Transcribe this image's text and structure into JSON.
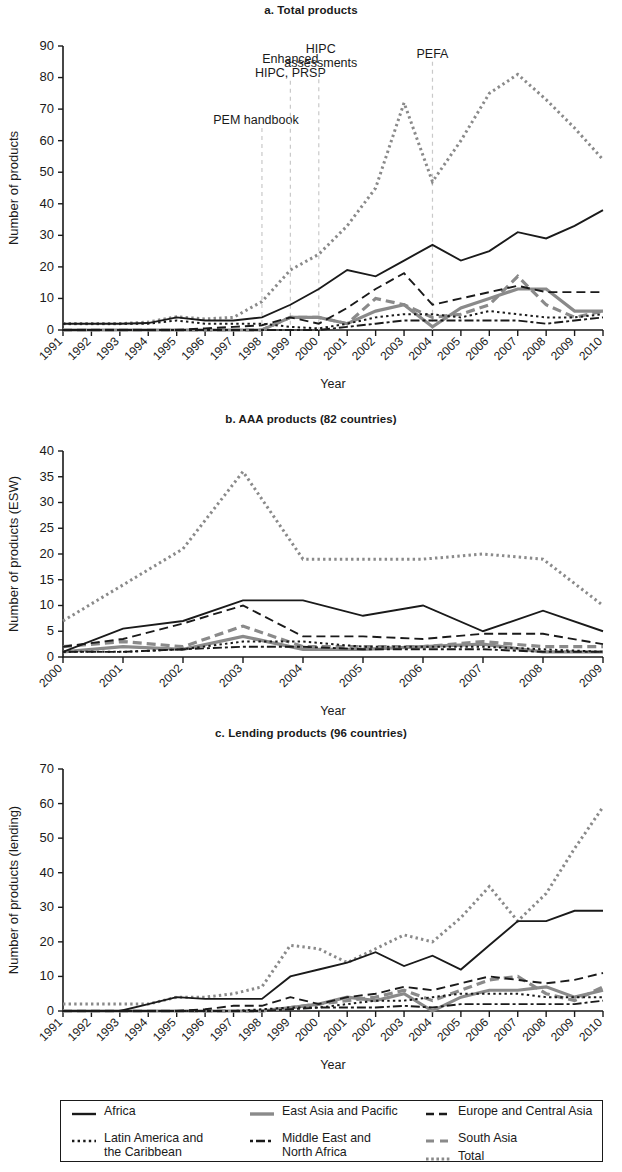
{
  "figure": {
    "axis_x_title": "Year",
    "panels": [
      {
        "id": "a",
        "title": "a. Total products",
        "ylabel": "Number of products"
      },
      {
        "id": "b",
        "title": "b. AAA products (82 countries)",
        "ylabel": "Number of products (ESW)"
      },
      {
        "id": "c",
        "title": "c. Lending products (96 countries)",
        "ylabel": "Number of products (lending)"
      }
    ]
  },
  "legend": {
    "items": [
      {
        "label": "Africa",
        "style": "solid",
        "color": "#1a1a1a"
      },
      {
        "label": "East Asia and Pacific",
        "style": "solid",
        "color": "#8a8a8a"
      },
      {
        "label": "Europe and Central Asia",
        "style": "dashed",
        "color": "#1a1a1a"
      },
      {
        "label": "Latin America and the Caribbean",
        "style": "dotted",
        "color": "#1a1a1a"
      },
      {
        "label": "Middle East and North Africa",
        "style": "dashdot",
        "color": "#1a1a1a"
      },
      {
        "label": "South Asia",
        "style": "dashed",
        "color": "#8a8a8a"
      },
      {
        "label": "Total",
        "style": "dotted",
        "color": "#8a8a8a"
      }
    ],
    "cells": [
      [
        "Africa"
      ],
      [
        "East Asia and Pacific"
      ],
      [
        "Europe and Central Asia"
      ],
      [
        "Latin America and",
        "the Caribbean"
      ],
      [
        "Middle East and",
        "North Africa"
      ],
      [
        "South Asia",
        "Total"
      ]
    ]
  },
  "chart_data": [
    {
      "type": "line",
      "id": "a",
      "title": "a. Total products",
      "xlabel": "Year",
      "ylabel": "Number of products",
      "ylim": [
        0,
        90
      ],
      "yticks": [
        0,
        10,
        20,
        30,
        40,
        50,
        60,
        70,
        80,
        90
      ],
      "grid": false,
      "legend_position": "bottom-shared",
      "x": [
        1991,
        1992,
        1993,
        1994,
        1995,
        1996,
        1997,
        1998,
        1999,
        2000,
        2001,
        2002,
        2003,
        2004,
        2005,
        2006,
        2007,
        2008,
        2009,
        2010
      ],
      "annotations": [
        {
          "text": "PEM handbook",
          "x": 1998,
          "y": 64
        },
        {
          "text": "Enhanced HIPC, PRSP",
          "x": 1999,
          "y": 79
        },
        {
          "text": "HIPC assessments",
          "x": 2000,
          "y": 82
        },
        {
          "text": "PEFA",
          "x": 2004,
          "y": 85
        }
      ],
      "series": [
        {
          "name": "Africa",
          "style": "solid",
          "color": "#1a1a1a",
          "values": [
            2,
            2,
            2,
            2.2,
            4,
            3,
            3,
            4,
            8,
            13,
            19,
            17,
            22,
            27,
            22,
            25,
            31,
            29,
            33,
            38,
            36,
            25
          ]
        },
        {
          "name": "Total",
          "style": "dotted",
          "color": "#8a8a8a",
          "values": [
            2,
            2,
            2,
            2.5,
            4.2,
            3.5,
            4,
            9,
            19,
            24,
            33,
            45,
            72,
            47,
            60,
            75,
            81,
            73,
            64,
            54
          ]
        },
        {
          "name": "Europe and Central Asia",
          "style": "dashed",
          "color": "#1a1a1a",
          "values": [
            0,
            0,
            0,
            0,
            0,
            0.5,
            1,
            1.5,
            4,
            2,
            7,
            13,
            18,
            8,
            10,
            12,
            14,
            12,
            12,
            12
          ]
        },
        {
          "name": "East Asia and Pacific",
          "style": "solid",
          "color": "#8a8a8a",
          "values": [
            0,
            0,
            0,
            0,
            0,
            0,
            0,
            0,
            4,
            4,
            2,
            6,
            8,
            1,
            7,
            10,
            13,
            13,
            6,
            6
          ]
        },
        {
          "name": "South Asia",
          "style": "dashed",
          "color": "#8a8a8a",
          "values": [
            0,
            0,
            0,
            0,
            0,
            0,
            0,
            0,
            4,
            4,
            2,
            10,
            8,
            4,
            5,
            8,
            17,
            8,
            4,
            6
          ]
        },
        {
          "name": "Latin America and the Caribbean",
          "style": "dotted",
          "color": "#1a1a1a",
          "values": [
            2,
            2,
            2,
            2,
            3,
            2,
            2,
            2,
            1,
            0.5,
            2,
            4,
            5,
            5,
            4,
            6,
            5,
            4,
            4,
            5
          ]
        },
        {
          "name": "Middle East and North Africa",
          "style": "dashdot",
          "color": "#1a1a1a",
          "values": [
            0,
            0,
            0,
            0,
            0,
            0,
            0,
            0,
            0,
            0,
            1,
            2,
            3,
            3,
            3,
            3,
            3,
            2,
            3,
            4
          ]
        }
      ]
    },
    {
      "type": "line",
      "id": "b",
      "title": "b. AAA products (82 countries)",
      "xlabel": "Year",
      "ylabel": "Number of products (ESW)",
      "ylim": [
        0,
        40
      ],
      "yticks": [
        0,
        5,
        10,
        15,
        20,
        25,
        30,
        35,
        40
      ],
      "grid": false,
      "legend_position": "bottom-shared",
      "x": [
        2000,
        2001,
        2002,
        2003,
        2004,
        2005,
        2006,
        2007,
        2008,
        2009
      ],
      "annotations": [],
      "series": [
        {
          "name": "Total",
          "style": "dotted",
          "color": "#8a8a8a",
          "values": [
            7,
            14,
            21,
            36,
            19,
            19,
            19,
            20,
            19,
            10
          ]
        },
        {
          "name": "Africa",
          "style": "solid",
          "color": "#1a1a1a",
          "values": [
            1,
            5.5,
            7,
            11,
            11,
            8,
            10,
            5,
            9,
            5
          ]
        },
        {
          "name": "Europe and Central Asia",
          "style": "dashed",
          "color": "#1a1a1a",
          "values": [
            2,
            3.5,
            6.5,
            10,
            4,
            4,
            3.5,
            4.5,
            4.5,
            2.5
          ]
        },
        {
          "name": "South Asia",
          "style": "dashed",
          "color": "#8a8a8a",
          "values": [
            2,
            3,
            2,
            6,
            2,
            2,
            2,
            3,
            2,
            2
          ]
        },
        {
          "name": "Latin America and the Caribbean",
          "style": "dotted",
          "color": "#1a1a1a",
          "values": [
            1,
            1,
            1.5,
            3,
            3,
            2,
            2,
            2,
            1.5,
            1
          ]
        },
        {
          "name": "East Asia and Pacific",
          "style": "solid",
          "color": "#8a8a8a",
          "values": [
            1,
            2,
            1.5,
            4,
            1.5,
            1.5,
            2,
            2.5,
            1,
            1
          ]
        },
        {
          "name": "Middle East and North Africa",
          "style": "dashdot",
          "color": "#1a1a1a",
          "values": [
            1,
            1,
            1.5,
            2,
            2,
            1.5,
            1.5,
            1.5,
            1,
            1
          ]
        }
      ]
    },
    {
      "type": "line",
      "id": "c",
      "title": "c. Lending products (96 countries)",
      "xlabel": "Year",
      "ylabel": "Number of products (lending)",
      "ylim": [
        0,
        70
      ],
      "yticks": [
        0,
        10,
        20,
        30,
        40,
        50,
        60,
        70
      ],
      "grid": false,
      "legend_position": "bottom-shared",
      "x": [
        1991,
        1992,
        1993,
        1994,
        1995,
        1996,
        1997,
        1998,
        1999,
        2000,
        2001,
        2002,
        2003,
        2004,
        2005,
        2006,
        2007,
        2008,
        2009,
        2010
      ],
      "annotations": [],
      "series": [
        {
          "name": "Total",
          "style": "dotted",
          "color": "#8a8a8a",
          "values": [
            2,
            2,
            2,
            2,
            4,
            4,
            5,
            7,
            19,
            18,
            14,
            18,
            22,
            20,
            27,
            36,
            26,
            34,
            47,
            59,
            61,
            55,
            57,
            56,
            53
          ]
        },
        {
          "name": "Africa",
          "style": "solid",
          "color": "#1a1a1a",
          "values": [
            0,
            0,
            0,
            2,
            4,
            3.5,
            3.5,
            3.5,
            10,
            12,
            14,
            17,
            13,
            16,
            12,
            19,
            26,
            26,
            29,
            29,
            25
          ]
        },
        {
          "name": "Europe and Central Asia",
          "style": "dashed",
          "color": "#1a1a1a",
          "values": [
            0,
            0,
            0,
            0,
            0,
            0.5,
            1.5,
            1.5,
            4,
            2,
            4,
            5,
            7,
            6,
            8,
            10,
            9,
            8,
            9,
            11
          ]
        },
        {
          "name": "South Asia",
          "style": "dashed",
          "color": "#8a8a8a",
          "values": [
            0,
            0,
            0,
            0,
            0,
            0,
            0,
            0,
            1,
            2,
            3,
            4,
            6,
            3,
            6,
            9,
            10,
            5,
            3,
            7
          ]
        },
        {
          "name": "East Asia and Pacific",
          "style": "solid",
          "color": "#8a8a8a",
          "values": [
            0,
            0,
            0,
            0,
            0,
            0,
            0,
            0,
            1,
            2,
            4,
            3,
            5,
            0,
            4,
            6,
            6,
            7,
            4,
            6
          ]
        },
        {
          "name": "Latin America and the Caribbean",
          "style": "dotted",
          "color": "#1a1a1a",
          "values": [
            0,
            0,
            0,
            0,
            0,
            0,
            0,
            0.5,
            1,
            1,
            2,
            3,
            3,
            4,
            5,
            5,
            5,
            4,
            4,
            4
          ]
        },
        {
          "name": "Middle East and North Africa",
          "style": "dashdot",
          "color": "#1a1a1a",
          "values": [
            0,
            0,
            0,
            0,
            0,
            0,
            0,
            0,
            0.5,
            1,
            1,
            1,
            1.5,
            1,
            2,
            2,
            2,
            2,
            2,
            3
          ]
        }
      ]
    }
  ]
}
